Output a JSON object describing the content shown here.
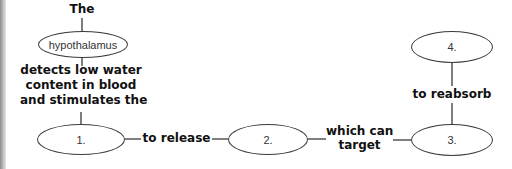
{
  "diagram": {
    "type": "concept-map",
    "nodes": {
      "top_label": "The",
      "hypothalamus": "hypothalamus",
      "n1": "1.",
      "n2": "2.",
      "n3": "3.",
      "n4": "4."
    },
    "links": {
      "detects_line1": "detects low water",
      "detects_line2": "content in blood",
      "detects_line3": "and stimulates the",
      "to_release": "to release",
      "which_can": "which can",
      "target": "target",
      "to_reabsorb": "to reabsorb"
    }
  },
  "colors": {
    "line": "#3a3a3a",
    "text": "#111111",
    "border": "#9a9a9a"
  }
}
